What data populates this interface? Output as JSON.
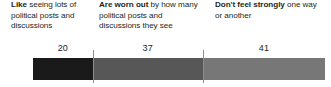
{
  "chart_data": {
    "type": "bar",
    "subtype": "stacked-horizontal-100pct",
    "title": "",
    "subtitle": "",
    "xlabel": "",
    "ylabel": "",
    "grid": false,
    "legend_position": "top-inline",
    "xlim": [
      0,
      100
    ],
    "categories": [
      "Like seeing lots of political posts and discussions",
      "Are worn out by how many political posts and discussions they see",
      "Don't feel strongly one way or another"
    ],
    "values": [
      20,
      37,
      41
    ],
    "value_labels": [
      "20",
      "37",
      "41"
    ],
    "colors": [
      "#1a1a1a",
      "#575757",
      "#777777"
    ]
  },
  "segments": [
    {
      "lead": "Like",
      "rest": " seeing lots of political posts and discussions",
      "value_label": "20",
      "color": "#1a1a1a"
    },
    {
      "lead": "Are worn out",
      "rest": " by how many political posts and discussions they see",
      "value_label": "37",
      "color": "#575757"
    },
    {
      "lead": "Don't feel strongly",
      "rest": " one way or another",
      "value_label": "41",
      "color": "#777777"
    }
  ]
}
